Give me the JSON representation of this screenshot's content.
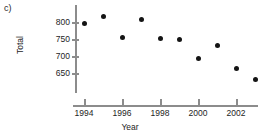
{
  "panel_label": "c)",
  "chart_data": {
    "type": "scatter",
    "title": "",
    "xlabel": "Year",
    "ylabel": "Total",
    "x": [
      1994,
      1995,
      1996,
      1997,
      1998,
      1999,
      2000,
      2001,
      2002,
      2003
    ],
    "values": [
      797,
      815,
      754,
      806,
      752,
      749,
      694,
      730,
      662,
      630
    ],
    "series": [
      {
        "name": "Total",
        "points": [
          {
            "x": 1994,
            "y": 797
          },
          {
            "x": 1995,
            "y": 815
          },
          {
            "x": 1996,
            "y": 754
          },
          {
            "x": 1997,
            "y": 806
          },
          {
            "x": 1998,
            "y": 752
          },
          {
            "x": 1999,
            "y": 749
          },
          {
            "x": 2000,
            "y": 694
          },
          {
            "x": 2001,
            "y": 730
          },
          {
            "x": 2002,
            "y": 662
          },
          {
            "x": 2003,
            "y": 630
          }
        ]
      }
    ],
    "xticks": [
      1994,
      1996,
      1998,
      2000,
      2002
    ],
    "xtick_labels": [
      "1994",
      "1996",
      "1998",
      "2000",
      "2002"
    ],
    "yticks": [
      650,
      700,
      750,
      800
    ],
    "ytick_labels": [
      "650",
      "700",
      "750",
      "800"
    ],
    "xlim": [
      1993.2,
      2003.8
    ],
    "ylim": [
      620,
      825
    ],
    "grid": false,
    "legend": false,
    "marker_color": "#141414",
    "axis_color": "#8c8c8c",
    "text_color": "#242424",
    "background": "#ffffff"
  }
}
